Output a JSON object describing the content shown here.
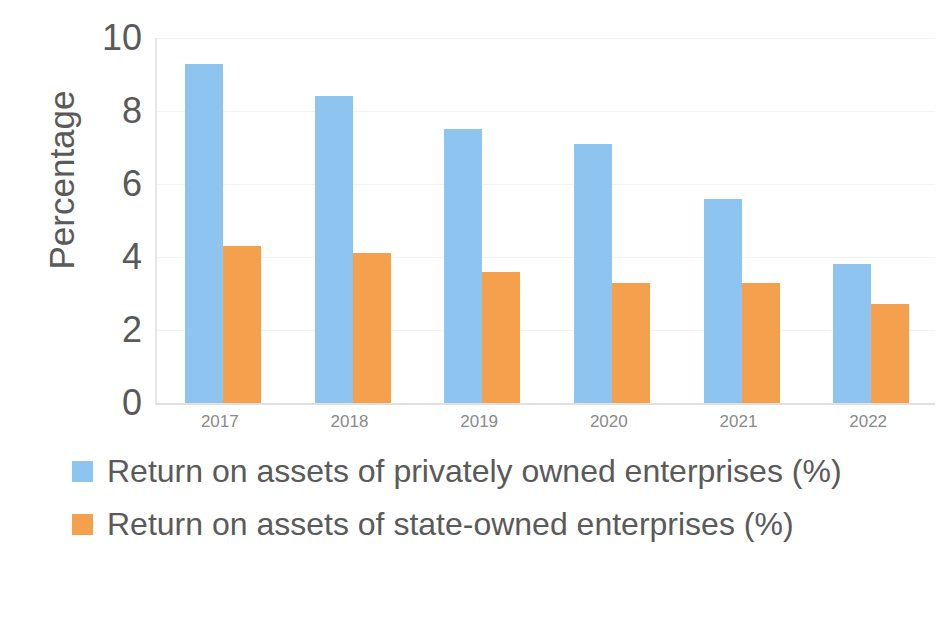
{
  "chart_data": {
    "type": "bar",
    "title": "",
    "subtitle": "",
    "xlabel": "",
    "ylabel": "Percentage",
    "ylim": [
      0,
      10
    ],
    "y_ticks": [
      10,
      8,
      6,
      4,
      2,
      0
    ],
    "grid": true,
    "legend_position": "bottom-left",
    "categories": [
      "2017",
      "2018",
      "2019",
      "2020",
      "2021",
      "2022"
    ],
    "series": [
      {
        "name": "Return on assets of privately owned enterprises (%)",
        "color": "#8EC5F0",
        "values": [
          9.3,
          8.4,
          7.5,
          7.1,
          5.6,
          3.8
        ]
      },
      {
        "name": "Return on assets of state-owned enterprises (%)",
        "color": "#F4A04C",
        "values": [
          4.3,
          4.1,
          3.6,
          3.3,
          3.3,
          2.7
        ]
      }
    ]
  },
  "legend": {
    "items": [
      {
        "label": "Return on assets of privately owned enterprises (%)",
        "color": "#8EC5F0"
      },
      {
        "label": "Return on assets of state-owned enterprises (%)",
        "color": "#F4A04C"
      }
    ]
  },
  "axes": {
    "y_title": "Percentage",
    "y_tick_labels": [
      "10",
      "8",
      "6",
      "4",
      "2",
      "0"
    ],
    "x_tick_labels": [
      "2017",
      "2018",
      "2019",
      "2020",
      "2021",
      "2022"
    ]
  },
  "colors": {
    "series_a": "#8EC5F0",
    "series_b": "#F4A04C",
    "axis_line": "#E4E4E4",
    "gridline": "#F4F4F4",
    "text": "#595959",
    "tick_text": "#8A8A8A",
    "background": "#FFFFFF"
  }
}
